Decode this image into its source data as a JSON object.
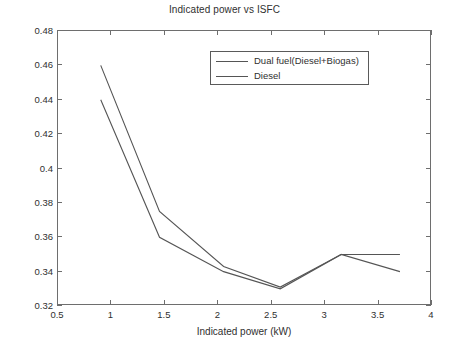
{
  "chart_data": {
    "type": "line",
    "title": "Indicated power vs ISFC",
    "xlabel": "Indicated power (kW)",
    "ylabel": "ISFC (kg/kWh)",
    "xlim": [
      0.5,
      4
    ],
    "ylim": [
      0.32,
      0.48
    ],
    "xticks": [
      "0.5",
      "1",
      "1.5",
      "2",
      "2.5",
      "3",
      "3.5",
      "4"
    ],
    "xtick_values": [
      0.5,
      1,
      1.5,
      2,
      2.5,
      3,
      3.5,
      4
    ],
    "yticks": [
      "0.32",
      "0.34",
      "0.36",
      "0.38",
      "0.4",
      "0.42",
      "0.44",
      "0.46",
      "0.48"
    ],
    "ytick_values": [
      0.32,
      0.34,
      0.36,
      0.38,
      0.4,
      0.42,
      0.44,
      0.46,
      0.48
    ],
    "grid": false,
    "legend_position": "top-center",
    "line_color": "#555555",
    "axis_color": "#6e6e6e",
    "series": [
      {
        "name": "Dual fuel(Diesel+Biogas)",
        "x": [
          0.9,
          1.45,
          2.05,
          2.58,
          3.15,
          3.7
        ],
        "values": [
          0.46,
          0.375,
          0.343,
          0.331,
          0.35,
          0.35
        ]
      },
      {
        "name": "Diesel",
        "x": [
          0.9,
          1.45,
          2.05,
          2.58,
          3.15,
          3.7
        ],
        "values": [
          0.44,
          0.36,
          0.34,
          0.33,
          0.35,
          0.34
        ]
      }
    ]
  },
  "legend": {
    "items": [
      {
        "label": "Dual fuel(Diesel+Biogas)"
      },
      {
        "label": "Diesel"
      }
    ]
  }
}
